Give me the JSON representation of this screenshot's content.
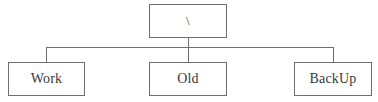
{
  "diagram": {
    "type": "tree",
    "orientation": "top-down",
    "colors": {
      "line": "#6e6e6e",
      "text": "#3a3a3a",
      "background": "#ffffff"
    },
    "root": {
      "id": "root",
      "label": "\\",
      "name": "root-node"
    },
    "children": [
      {
        "id": "work",
        "label": "Work",
        "name": "work-node"
      },
      {
        "id": "old",
        "label": "Old",
        "name": "old-node"
      },
      {
        "id": "backup",
        "label": "BackUp",
        "name": "backup-node"
      }
    ],
    "edges": [
      {
        "from": "root",
        "to": "work"
      },
      {
        "from": "root",
        "to": "old"
      },
      {
        "from": "root",
        "to": "backup"
      }
    ]
  }
}
